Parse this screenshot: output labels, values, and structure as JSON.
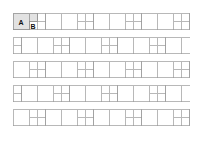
{
  "figure": {
    "background_color": "#ffffff",
    "canvas": {
      "width": 203,
      "height": 142
    },
    "pattern": {
      "type": "pinwheel",
      "origin_x": 13,
      "origin_y": 13,
      "module": 24,
      "large_size": 16,
      "small_size": 8,
      "cols": 8,
      "rows": 6,
      "clip": {
        "x": 13,
        "y": 13,
        "width": 177,
        "height": 118
      },
      "stroke_color": "#9a9a9a",
      "stroke_width": 0.7,
      "tile_fill": "#ffffff"
    },
    "highlight": {
      "fill": "#e2e2e2",
      "stroke": "#8a8a8a",
      "large_tile": {
        "x": 13,
        "y": 13,
        "size": 16
      },
      "small_tile": {
        "x": 29,
        "y": 13,
        "size": 8
      }
    },
    "labels": [
      {
        "id": "label-a",
        "text": "A",
        "x": 21,
        "y": 22.5,
        "refers_to": "large-square-tile"
      },
      {
        "id": "label-b",
        "text": "B",
        "x": 33,
        "y": 26.5,
        "refers_to": "small-square-tile"
      }
    ]
  }
}
